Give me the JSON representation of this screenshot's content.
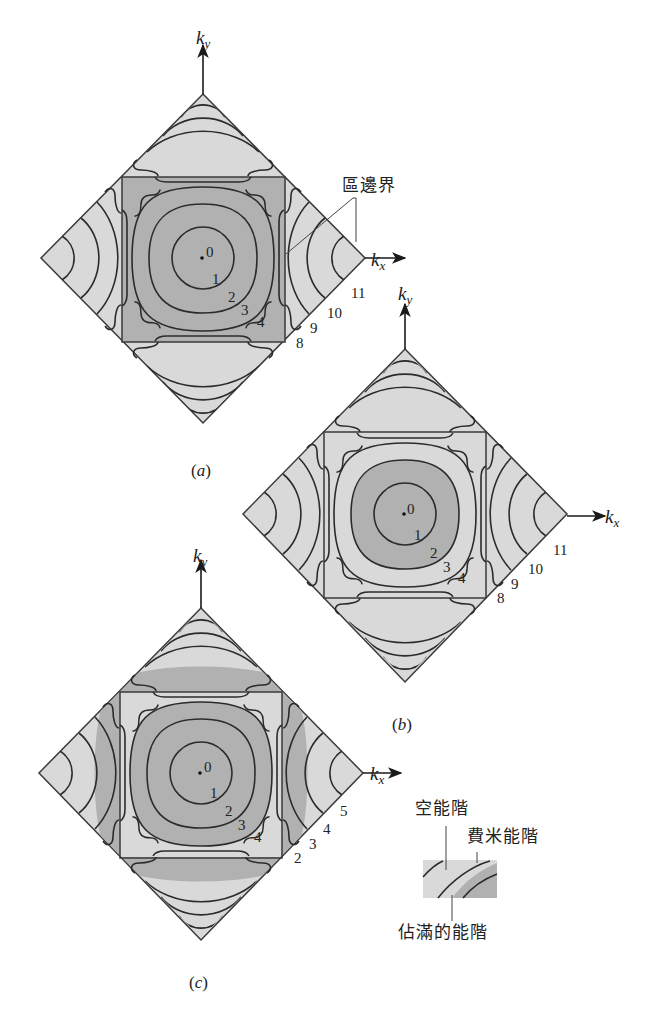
{
  "figure": {
    "panels": [
      {
        "id": "a",
        "caption_open": "(",
        "caption_letter": "a",
        "caption_close": ")",
        "axis_x": "k",
        "axis_x_sub": "x",
        "axis_y": "k",
        "axis_y_sub": "y",
        "inner_labels": [
          "0",
          "1",
          "2",
          "3",
          "4"
        ],
        "edge_labels": [
          "8",
          "9",
          "10",
          "11"
        ],
        "filled_region": "entire first zone square"
      },
      {
        "id": "b",
        "caption_open": "(",
        "caption_letter": "b",
        "caption_close": ")",
        "axis_x": "k",
        "axis_x_sub": "x",
        "axis_y": "k",
        "axis_y_sub": "y",
        "inner_labels": [
          "0",
          "1",
          "2",
          "3",
          "4"
        ],
        "edge_labels": [
          "8",
          "9",
          "10",
          "11"
        ],
        "filled_region": "inside contour 2"
      },
      {
        "id": "c",
        "caption_open": "(",
        "caption_letter": "c",
        "caption_close": ")",
        "axis_x": "k",
        "axis_x_sub": "x",
        "axis_y": "k",
        "axis_y_sub": "y",
        "inner_labels": [
          "0",
          "1",
          "2",
          "3",
          "4"
        ],
        "edge_labels": [
          "2",
          "3",
          "4",
          "5"
        ],
        "filled_region": "inside contour 3 plus outer band"
      }
    ],
    "annotations": {
      "zone_boundary": "區邊界",
      "empty_levels": "空能階",
      "fermi_level": "費米能階",
      "occupied_levels": "佔滿的能階"
    },
    "colors": {
      "empty_fill": "#d9d9d9",
      "occupied_fill": "#b1b1b1",
      "line": "#2b2b2b"
    }
  }
}
